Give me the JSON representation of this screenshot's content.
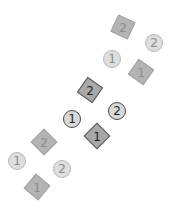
{
  "canvas": {
    "width": 179,
    "height": 216,
    "background": "#ffffff"
  },
  "groups": [
    {
      "name": "top-group",
      "state": "faded",
      "markers": [
        {
          "shape": "square",
          "label": "2",
          "x": 123,
          "y": 27,
          "rotation": 25
        },
        {
          "shape": "circle",
          "label": "2",
          "x": 154,
          "y": 43,
          "rotation": 0
        },
        {
          "shape": "circle",
          "label": "1",
          "x": 112,
          "y": 59,
          "rotation": 0
        },
        {
          "shape": "square",
          "label": "1",
          "x": 141,
          "y": 72,
          "rotation": 35
        }
      ]
    },
    {
      "name": "middle-group",
      "state": "active",
      "markers": [
        {
          "shape": "square",
          "label": "2",
          "x": 90,
          "y": 90,
          "rotation": 35
        },
        {
          "shape": "circle",
          "label": "2",
          "x": 117,
          "y": 111,
          "rotation": 0
        },
        {
          "shape": "circle",
          "label": "1",
          "x": 72,
          "y": 119,
          "rotation": 0
        },
        {
          "shape": "square",
          "label": "1",
          "x": 97,
          "y": 136,
          "rotation": 45
        }
      ]
    },
    {
      "name": "bottom-group",
      "state": "faded",
      "markers": [
        {
          "shape": "square",
          "label": "2",
          "x": 44,
          "y": 142,
          "rotation": 45
        },
        {
          "shape": "circle",
          "label": "2",
          "x": 62,
          "y": 169,
          "rotation": 0
        },
        {
          "shape": "circle",
          "label": "1",
          "x": 17,
          "y": 161,
          "rotation": 0
        },
        {
          "shape": "square",
          "label": "1",
          "x": 37,
          "y": 187,
          "rotation": 40
        }
      ]
    }
  ],
  "colors": {
    "faded_square_fill": "#b4b4b4",
    "faded_circle_fill": "#dedede",
    "faded_label": "#8c8c8c",
    "active_square_fill": "#a8a8a8",
    "active_border": "#4a4a4a",
    "active_label": "#1e1e1e"
  }
}
